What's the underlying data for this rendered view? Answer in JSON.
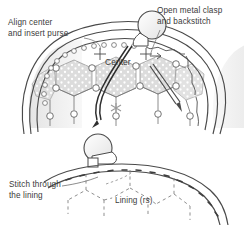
{
  "diagram": {
    "background_color": "#ffffff",
    "ink_color": "#3b3b3b",
    "mesh_fill_color": "#d9d9d9",
    "labels": {
      "align": "Align center\nand insert purse",
      "clasp": "Open metal clasp\nand backstitch",
      "center": "Center",
      "stitch": "Stitch through\nthe lining",
      "lining": "Lining (rs)"
    },
    "figures": [
      {
        "name": "upper-purse-figure",
        "description": "Purse with open metal clasp, hexagonal crochet mesh, needle and thread, center marks"
      },
      {
        "name": "lower-lining-figure",
        "description": "Close-up of clasp knob with dashed backstitch line through lining hexagon mesh"
      }
    ]
  }
}
